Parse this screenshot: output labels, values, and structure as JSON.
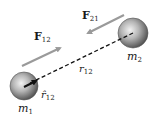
{
  "diagram": {
    "masses": [
      {
        "id": "m1",
        "label": "m",
        "sub": "1"
      },
      {
        "id": "m2",
        "label": "m",
        "sub": "2"
      }
    ],
    "forces": [
      {
        "id": "F12",
        "label": "F",
        "sub": "12",
        "direction": "toward m2"
      },
      {
        "id": "F21",
        "label": "F",
        "sub": "21",
        "direction": "toward m1"
      }
    ],
    "separation": {
      "label": "r",
      "sub": "12"
    },
    "unit_vector": {
      "label": "r̂",
      "sub": "12"
    },
    "colors": {
      "arrow": "#9a9a9a",
      "sphere": "#8a8a8a",
      "line": "#111111"
    }
  }
}
